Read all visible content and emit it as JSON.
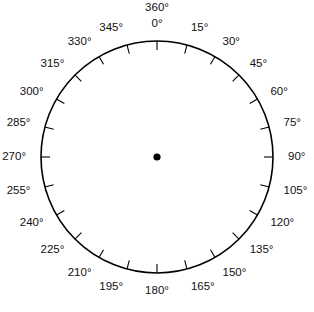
{
  "figure": {
    "kind": "protractor-dial",
    "background_color": "#ffffff",
    "stroke_color": "#000000",
    "label_color": "#111111",
    "center_dot_name": "center-point"
  },
  "chart_data": {
    "type": "scatter",
    "title": "",
    "subtitle": "",
    "xlabel": "",
    "ylabel": "",
    "grid": false,
    "legend": null,
    "geometry": {
      "center_x": 157,
      "center_y": 157,
      "radius": 116,
      "tick_length": 9,
      "label_offset": 15,
      "zero_direction": "up",
      "direction": "clockwise"
    },
    "angle_step": 15,
    "angle_min": 0,
    "angle_max": 360,
    "tick_count": 24,
    "categories": [
      "0°",
      "15°",
      "30°",
      "45°",
      "60°",
      "75°",
      "90°",
      "105°",
      "120°",
      "135°",
      "150°",
      "165°",
      "180°",
      "195°",
      "210°",
      "225°",
      "240°",
      "255°",
      "270°",
      "285°",
      "300°",
      "315°",
      "330°",
      "345°"
    ],
    "values": [
      0,
      15,
      30,
      45,
      60,
      75,
      90,
      105,
      120,
      135,
      150,
      165,
      180,
      195,
      210,
      225,
      240,
      255,
      270,
      285,
      300,
      315,
      330,
      345
    ],
    "ticks": [
      {
        "angle": 0,
        "label": "0°",
        "extra_label": "360°"
      },
      {
        "angle": 15,
        "label": "15°",
        "extra_label": null
      },
      {
        "angle": 30,
        "label": "30°",
        "extra_label": null
      },
      {
        "angle": 45,
        "label": "45°",
        "extra_label": null
      },
      {
        "angle": 60,
        "label": "60°",
        "extra_label": null
      },
      {
        "angle": 75,
        "label": "75°",
        "extra_label": null
      },
      {
        "angle": 90,
        "label": "90°",
        "extra_label": null
      },
      {
        "angle": 105,
        "label": "105°",
        "extra_label": null
      },
      {
        "angle": 120,
        "label": "120°",
        "extra_label": null
      },
      {
        "angle": 135,
        "label": "135°",
        "extra_label": null
      },
      {
        "angle": 150,
        "label": "150°",
        "extra_label": null
      },
      {
        "angle": 165,
        "label": "165°",
        "extra_label": null
      },
      {
        "angle": 180,
        "label": "180°",
        "extra_label": null
      },
      {
        "angle": 195,
        "label": "195°",
        "extra_label": null
      },
      {
        "angle": 210,
        "label": "210°",
        "extra_label": null
      },
      {
        "angle": 225,
        "label": "225°",
        "extra_label": null
      },
      {
        "angle": 240,
        "label": "240°",
        "extra_label": null
      },
      {
        "angle": 255,
        "label": "255°",
        "extra_label": null
      },
      {
        "angle": 270,
        "label": "270°",
        "extra_label": null
      },
      {
        "angle": 285,
        "label": "285°",
        "extra_label": null
      },
      {
        "angle": 300,
        "label": "300°",
        "extra_label": null
      },
      {
        "angle": 315,
        "label": "315°",
        "extra_label": null
      },
      {
        "angle": 330,
        "label": "330°",
        "extra_label": null
      },
      {
        "angle": 345,
        "label": "345°",
        "extra_label": null
      }
    ],
    "points": [
      {
        "name": "center-point",
        "x": 157,
        "y": 157,
        "radius": 3.6,
        "color": "#000000"
      }
    ]
  }
}
